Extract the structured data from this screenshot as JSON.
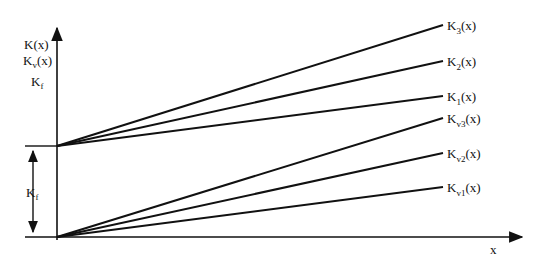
{
  "diagram": {
    "y_axis_label_lines": [
      "K(x)",
      "Kv(x)",
      "Kf"
    ],
    "x_axis_label": "x",
    "gap_label": "Kf",
    "upper_group": [
      {
        "base": "K",
        "sub": "3",
        "suffix": "(x)"
      },
      {
        "base": "K",
        "sub": "2",
        "suffix": "(x)"
      },
      {
        "base": "K",
        "sub": "1",
        "suffix": "(x)"
      }
    ],
    "lower_group": [
      {
        "base": "K",
        "sub": "v3",
        "suffix": "(x)"
      },
      {
        "base": "K",
        "sub": "v2",
        "suffix": "(x)"
      },
      {
        "base": "K",
        "sub": "v1",
        "suffix": "(x)"
      }
    ],
    "colors": {
      "line": "#111111",
      "background": "#ffffff"
    }
  }
}
